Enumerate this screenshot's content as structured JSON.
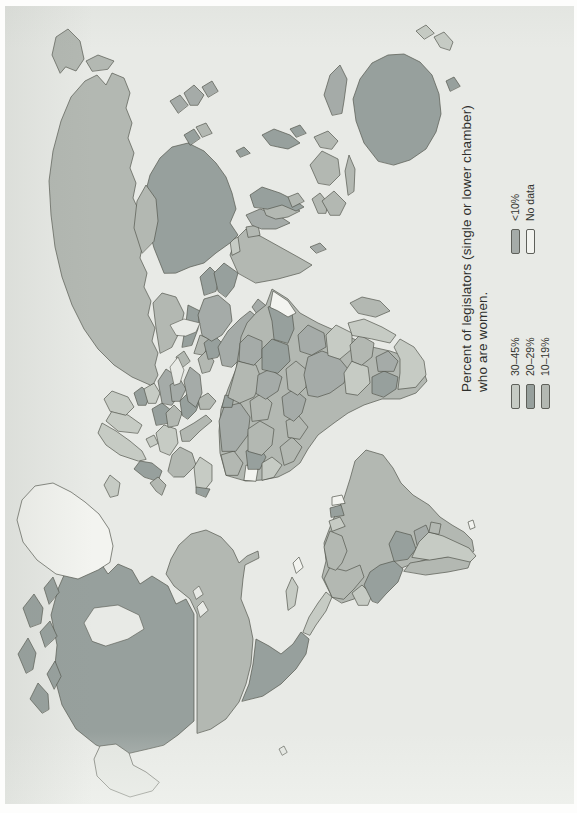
{
  "figure": {
    "title": {
      "line1": "Percent of legislators (single or lower chamber)",
      "line2": "who are women."
    },
    "legend": {
      "items": [
        {
          "label": "30–45%",
          "category": "p30_45"
        },
        {
          "label": "20–29%",
          "category": "p20_29"
        },
        {
          "label": "10–19%",
          "category": "p10_19"
        },
        {
          "label": "<10%",
          "category": "lt10"
        },
        {
          "label": "No data",
          "category": "no_data"
        }
      ]
    },
    "colors": {
      "p30_45": "#c6cbc4",
      "p20_29": "#97a09d",
      "p10_19": "#b3b8b2",
      "lt10": "#a5aba8",
      "no_data": "#f3f4f0",
      "faded": "#e2e5e0",
      "water": "#e8eae6",
      "ocean": "#e8eae6",
      "outline": "#55574f",
      "text": "#2e2f2c"
    },
    "orientation": "figure rotated 90 degrees counterclockwise (text reads bottom-to-top)",
    "map_type": "world choropleth",
    "regions": {
      "canada": "p20_29",
      "arctic-1": "p20_29",
      "arctic-2": "p20_29",
      "arctic-3": "p20_29",
      "arctic-4": "p20_29",
      "arctic-5": "p20_29",
      "arctic-6": "p20_29",
      "greenland": "no_data",
      "alaska": "faded",
      "hawaii": "faded",
      "usa": "p10_19",
      "mexico": "p20_29",
      "central-america": "p30_45",
      "cuba": "p30_45",
      "hispaniola": "no_data",
      "colombia": "p10_19",
      "venezuela": "p10_19",
      "guyana": "p30_45",
      "suriname": "p20_29",
      "french-guiana": "no_data",
      "ecuador": "p30_45",
      "peru": "p20_29",
      "brazil": "p10_19",
      "bolivia": "p20_29",
      "paraguay": "lt10",
      "chile": "p10_19",
      "argentina": "p30_45",
      "uruguay": "p10_19",
      "falklands": "no_data",
      "iceland": "p30_45",
      "uk": "p20_29",
      "ireland": "p10_19",
      "norway": "p30_45",
      "sweden": "p30_45",
      "finland": "p30_45",
      "denmark": "p30_45",
      "baltics": "p20_29",
      "germany": "p30_45",
      "poland": "p20_29",
      "belarus": "p30_45",
      "ukraine": "lt10",
      "france": "p10_19",
      "spain": "p30_45",
      "portugal": "p20_29",
      "italy": "p10_19",
      "czech-hungary": "p10_19",
      "balkans": "p20_29",
      "romania": "lt10",
      "greece": "p10_19",
      "russia": "p10_19",
      "chukotka": "p10_19",
      "kamchatka": "p10_19",
      "kazakhstan": "p10_19",
      "uzbekistan": "p20_29",
      "turkmenistan": "p10_19",
      "turkey": "lt10",
      "caucasus": "p10_19",
      "syria": "p10_19",
      "iraq": "p20_29",
      "iran": "lt10",
      "saudi-arabia": "lt10",
      "yemen-oman": "lt10",
      "afghanistan": "p20_29",
      "pakistan": "p20_29",
      "india": "p10_19",
      "nepal": "p30_45",
      "bangladesh": "p10_19",
      "sri-lanka": "lt10",
      "myanmar": "lt10",
      "thailand": "p10_19",
      "laos-vietnam": "p20_29",
      "cambodia": "p10_19",
      "malaysia": "p10_19",
      "china": "p20_29",
      "mongolia": "p10_19",
      "north-korea": "p20_29",
      "south-korea": "p10_19",
      "japan": "lt10",
      "taiwan": "p20_29",
      "philippines": "p20_29",
      "sumatra": "p10_19",
      "java": "p10_19",
      "borneo": "p10_19",
      "sulawesi": "p10_19",
      "new-guinea": "lt10",
      "australia": "p20_29",
      "tasmania": "p20_29",
      "new-zealand": "p30_45",
      "morocco": "p10_19",
      "algeria": "lt10",
      "tunisia": "p20_29",
      "libya": "p10_19",
      "egypt": "lt10",
      "western-sahara": "no_data",
      "mauritania": "p20_29",
      "mali": "p10_19",
      "niger": "p10_19",
      "chad": "lt10",
      "sudan": "p20_29",
      "ethiopia": "p20_29",
      "somalia": "no_data",
      "senegal": "p30_45",
      "guinea": "p10_19",
      "ghana": "p10_19",
      "nigeria": "lt10",
      "cameroon": "p10_19",
      "drc": "lt10",
      "kenya-uganda": "lt10",
      "tanzania": "p30_45",
      "angola": "p30_45",
      "zambia-zimbabwe": "p10_19",
      "mozambique": "p30_45",
      "namibia": "p20_29",
      "botswana": "lt10",
      "south-africa": "p30_45",
      "madagascar": "p10_19",
      "africa-base": "p10_19",
      "hudson-bay": "water",
      "great-lake-1": "water",
      "great-lake-2": "water",
      "black-sea": "water",
      "caspian-sea": "water"
    }
  }
}
